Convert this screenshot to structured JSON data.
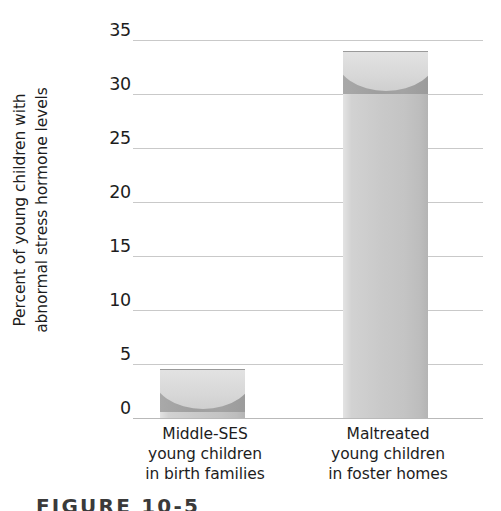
{
  "chart_data": {
    "type": "bar",
    "title": "",
    "xlabel": "",
    "ylabel": "Percent of young children with abnormal stress hormone levels",
    "ylabel_lines": [
      "Percent of young children with",
      "abnormal stress hormone levels"
    ],
    "categories": [
      "Middle-SES young children in birth families",
      "Maltreated young children in foster homes"
    ],
    "category_lines": [
      [
        "Middle-SES",
        "young children",
        "in birth families"
      ],
      [
        "Maltreated",
        "young children",
        "in foster homes"
      ]
    ],
    "values": [
      4.5,
      34
    ],
    "ylim": [
      0,
      35
    ],
    "yticks": [
      35,
      30,
      25,
      20,
      15,
      10,
      5,
      0
    ],
    "ytick_labels": [
      "35",
      "30",
      "25",
      "20",
      "15",
      "10",
      "5",
      "0"
    ],
    "grid": true,
    "legend": "none",
    "bar_color": "#c8c8c8",
    "gridline_color": "#c9c9c9",
    "text_color": "#1d1d1d"
  },
  "caption": {
    "text": "FIGURE 10-5"
  }
}
